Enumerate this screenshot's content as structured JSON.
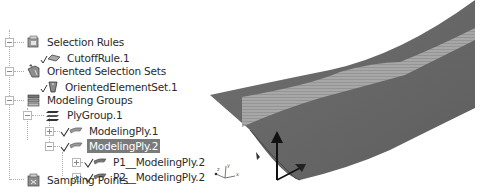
{
  "tree": {
    "items": [
      {
        "label": "Selection Rules",
        "icon": "selection-rules-icon",
        "expanded": true
      },
      {
        "label": "CutoffRule.1",
        "icon": "cutoff-rule-icon"
      },
      {
        "label": "Oriented Selection Sets",
        "icon": "oriented-selection-sets-icon",
        "expanded": true
      },
      {
        "label": "OrientedElementSet.1",
        "icon": "oriented-element-set-icon"
      },
      {
        "label": "Modeling Groups",
        "icon": "modeling-groups-icon",
        "expanded": true
      },
      {
        "label": "PlyGroup.1",
        "icon": "ply-group-icon",
        "expanded": true
      },
      {
        "label": "ModelingPly.1",
        "icon": "modeling-ply-icon",
        "expanded": false
      },
      {
        "label": "ModelingPly.2",
        "icon": "modeling-ply-icon",
        "expanded": true,
        "selected": true
      },
      {
        "label": "P1__ModelingPly.2",
        "icon": "production-ply-icon",
        "expanded": false
      },
      {
        "label": "P2__ModelingPly.2",
        "icon": "production-ply-icon",
        "expanded": false
      },
      {
        "label": "Sampling Points",
        "icon": "sampling-points-icon"
      }
    ]
  },
  "viewport": {
    "surface_color": "#6e6e6e",
    "stripe_color": "#a9a9a9",
    "arrow_color": "#111111",
    "triad_labels": {
      "x": "x",
      "y": "y",
      "z": "z"
    }
  }
}
